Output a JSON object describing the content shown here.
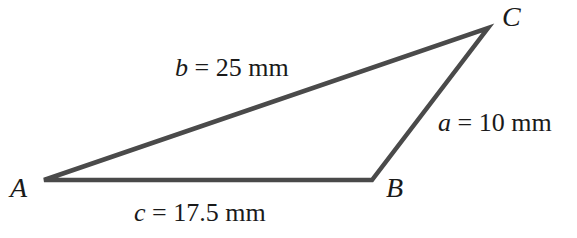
{
  "diagram": {
    "type": "triangle",
    "stroke_color": "#4a4a4a",
    "vertices": [
      {
        "name": "A",
        "x": 44,
        "y": 180
      },
      {
        "name": "B",
        "x": 372,
        "y": 180
      },
      {
        "name": "C",
        "x": 488,
        "y": 28
      }
    ],
    "sides": [
      {
        "var": "a",
        "eq": " = ",
        "value": "10 mm",
        "between": "B-C"
      },
      {
        "var": "b",
        "eq": " = ",
        "value": "25 mm",
        "between": "A-C"
      },
      {
        "var": "c",
        "eq": " = ",
        "value": "17.5 mm",
        "between": "A-B"
      }
    ],
    "vertex_labels": {
      "A": "A",
      "B": "B",
      "C": "C"
    }
  }
}
